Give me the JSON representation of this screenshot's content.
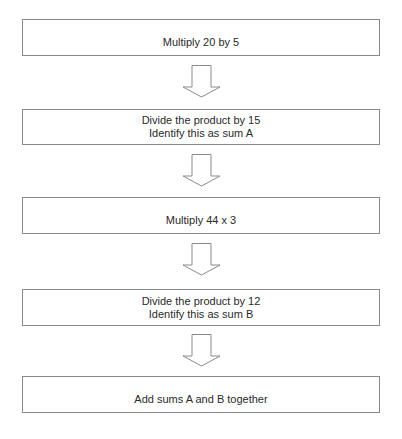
{
  "diagram": {
    "type": "flowchart",
    "direction": "top-to-bottom",
    "steps": [
      {
        "lines": [
          "Multiply 20 by 5"
        ]
      },
      {
        "lines": [
          "Divide the product by 15",
          "Identify this as sum A"
        ]
      },
      {
        "lines": [
          "Multiply 44 x 3"
        ]
      },
      {
        "lines": [
          "Divide the product by 12",
          "Identify this as sum B"
        ]
      },
      {
        "lines": [
          "Add sums A and B together"
        ]
      }
    ],
    "connector_icon": "hollow-down-arrow",
    "colors": {
      "border": "#8a8a8a",
      "text": "#2a2a2a",
      "background": "#ffffff"
    }
  }
}
